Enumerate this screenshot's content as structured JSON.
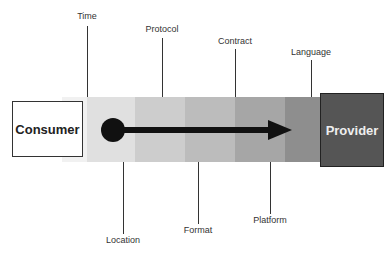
{
  "diagram": {
    "consumer": {
      "label": "Consumer"
    },
    "provider": {
      "label": "Provider"
    },
    "top_labels": [
      {
        "label": "Time"
      },
      {
        "label": "Protocol"
      },
      {
        "label": "Contract"
      },
      {
        "label": "Language"
      }
    ],
    "bottom_labels": [
      {
        "label": "Location"
      },
      {
        "label": "Format"
      },
      {
        "label": "Platform"
      }
    ],
    "bands": [
      {
        "color": "#f1f1f1"
      },
      {
        "color": "#e0e0e0"
      },
      {
        "color": "#cdcdcd"
      },
      {
        "color": "#bcbcbc"
      },
      {
        "color": "#a6a6a6"
      },
      {
        "color": "#8e8e8e"
      }
    ],
    "arrow": {
      "direction": "consumer-to-provider",
      "color": "#111111"
    }
  }
}
